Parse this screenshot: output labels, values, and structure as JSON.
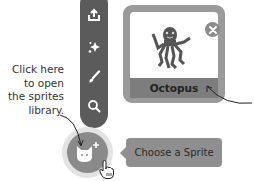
{
  "callout": {
    "lines": [
      "Click here",
      "to open",
      "the sprites",
      "library."
    ]
  },
  "sprite_menu": {
    "items": [
      {
        "icon": "upload-icon",
        "label": "Upload Sprite"
      },
      {
        "icon": "sparkle-icon",
        "label": "Surprise"
      },
      {
        "icon": "paintbrush-icon",
        "label": "Paint"
      },
      {
        "icon": "search-icon",
        "label": "Choose a Sprite"
      }
    ],
    "main_button_icon": "cat-plus-icon"
  },
  "tooltip": {
    "label": "Choose a Sprite"
  },
  "sprite_card": {
    "name": "Octopus",
    "close_icon": "close-icon"
  },
  "colors": {
    "menu": "#5b5b5b",
    "circle": "#8a8a8a",
    "tooltip": "#8f8f8f",
    "card": "#9a9a9a"
  }
}
